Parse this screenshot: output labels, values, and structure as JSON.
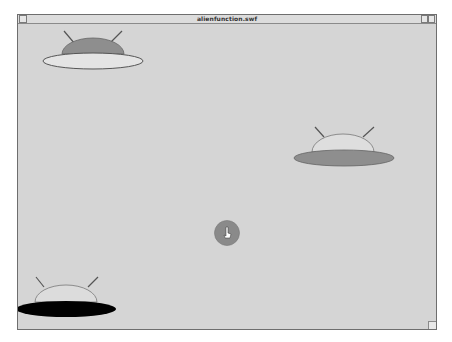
{
  "window": {
    "title": "alienfunction.swf"
  },
  "stage": {
    "background": "#d5d5d5",
    "ufos": [
      {
        "name": "ufo-top-left",
        "dome_fill": "#8e8e8e",
        "saucer_fill": "#e4e4e4"
      },
      {
        "name": "ufo-right",
        "dome_fill": "#dedede",
        "saucer_fill": "#8e8e8e"
      },
      {
        "name": "ufo-bottom-left",
        "dome_fill": "#dcdcdc",
        "saucer_fill": "#000000"
      }
    ],
    "circle": {
      "fill": "#8a8a8a"
    }
  }
}
